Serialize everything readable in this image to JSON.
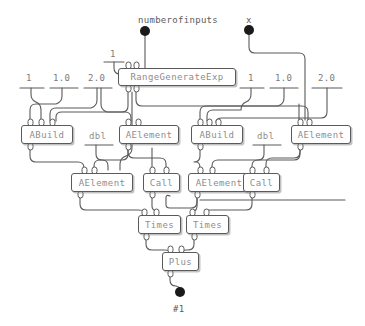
{
  "diagram": {
    "colors": {
      "background": "#ffffff",
      "wire": "#5a5a5a",
      "node_border": "#5a5a5a",
      "node_fill": "#ffffff",
      "node_text": "#8d8d8d",
      "terminal_dot": "#1a1a1a",
      "constant_text": "#7a7a7a"
    },
    "input_terminals": [
      {
        "name": "numberofinputs",
        "label": "numberofinputs",
        "x": 145,
        "y": 31
      },
      {
        "name": "x",
        "label": "x",
        "x": 249,
        "y": 30
      }
    ],
    "output_terminals": [
      {
        "name": "result",
        "label": "#1",
        "x": 180,
        "y": 292
      }
    ],
    "constants": [
      {
        "label": "1",
        "x": 112,
        "y": 56,
        "group": "top-center"
      },
      {
        "label": "1",
        "x": 29,
        "y": 80,
        "group": "left"
      },
      {
        "label": "1.0",
        "x": 57,
        "y": 80,
        "group": "left"
      },
      {
        "label": "2.0",
        "x": 92,
        "y": 80,
        "group": "left"
      },
      {
        "label": "1",
        "x": 250,
        "y": 80,
        "group": "right"
      },
      {
        "label": "1.0",
        "x": 279,
        "y": 80,
        "group": "right"
      },
      {
        "label": "2.0",
        "x": 322,
        "y": 80,
        "group": "right"
      }
    ],
    "free_labels": [
      {
        "label": "dbl",
        "x": 92,
        "y": 132
      },
      {
        "label": "dbl",
        "x": 260,
        "y": 132
      }
    ],
    "nodes": [
      {
        "id": "rangegenerateexp",
        "label": "RangeGenerateExp",
        "x": 118,
        "y": 68,
        "w": 118,
        "h": 18,
        "inputs": 2,
        "outputs": 2
      },
      {
        "id": "abuild-left",
        "label": "ABuild",
        "x": 21,
        "y": 125,
        "w": 52,
        "h": 19,
        "inputs": 3,
        "outputs": 1
      },
      {
        "id": "aelement-top-left",
        "label": "AElement",
        "x": 119,
        "y": 125,
        "w": 60,
        "h": 19,
        "inputs": 2,
        "outputs": 1
      },
      {
        "id": "abuild-right",
        "label": "ABuild",
        "x": 191,
        "y": 125,
        "w": 52,
        "h": 19,
        "inputs": 3,
        "outputs": 1
      },
      {
        "id": "aelement-top-right",
        "label": "AElement",
        "x": 291,
        "y": 125,
        "w": 60,
        "h": 19,
        "inputs": 2,
        "outputs": 1
      },
      {
        "id": "aelement-mid-left",
        "label": "AElement",
        "x": 71,
        "y": 173,
        "w": 62,
        "h": 19,
        "inputs": 2,
        "outputs": 1
      },
      {
        "id": "call-left",
        "label": "Call",
        "x": 143,
        "y": 173,
        "w": 37,
        "h": 19,
        "inputs": 2,
        "outputs": 1
      },
      {
        "id": "aelement-mid-right",
        "label": "AElement",
        "x": 188,
        "y": 173,
        "w": 62,
        "h": 19,
        "inputs": 2,
        "outputs": 1
      },
      {
        "id": "call-right",
        "label": "Call",
        "x": 243,
        "y": 173,
        "w": 37,
        "h": 19,
        "inputs": 2,
        "outputs": 1
      },
      {
        "id": "times-left",
        "label": "Times",
        "x": 138,
        "y": 215,
        "w": 43,
        "h": 19,
        "inputs": 2,
        "outputs": 1
      },
      {
        "id": "times-right",
        "label": "Times",
        "x": 186,
        "y": 215,
        "w": 43,
        "h": 19,
        "inputs": 2,
        "outputs": 1
      },
      {
        "id": "plus",
        "label": "Plus",
        "x": 162,
        "y": 252,
        "w": 37,
        "h": 19,
        "inputs": 2,
        "outputs": 1
      }
    ]
  }
}
